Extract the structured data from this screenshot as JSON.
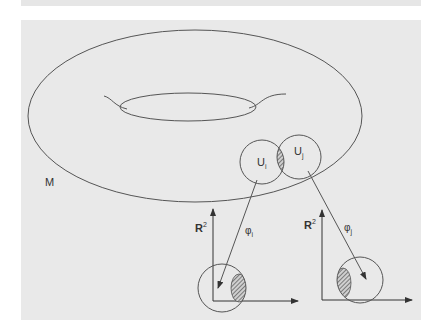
{
  "figure": {
    "manifold_label": "M",
    "chart_labels": {
      "ui": {
        "base": "U",
        "sub": "i"
      },
      "uj": {
        "base": "U",
        "sub": "j"
      }
    },
    "map_labels": {
      "phi_i": {
        "base": "φ",
        "sub": "i"
      },
      "phi_j": {
        "base": "φ",
        "sub": "j"
      }
    },
    "codomain_labels": {
      "left": {
        "base": "R",
        "sup": "2"
      },
      "right": {
        "base": "R",
        "sup": "2"
      }
    },
    "colors": {
      "background": "#e9e9e9",
      "stroke": "#555555",
      "text": "#333333",
      "hatch": "#555555"
    }
  }
}
